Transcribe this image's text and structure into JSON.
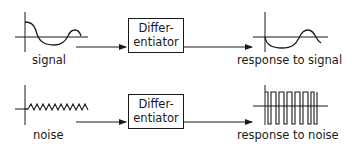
{
  "rows": [
    {
      "input_label": "signal",
      "block": {
        "line1": "Differ-",
        "line2": "entiator"
      },
      "output_label": "response to signal"
    },
    {
      "input_label": "noise",
      "block": {
        "line1": "Differ-",
        "line2": "entiator"
      },
      "output_label": "response to noise"
    }
  ],
  "colors": {
    "stroke": "#1a1a1a",
    "background": "#ffffff"
  }
}
